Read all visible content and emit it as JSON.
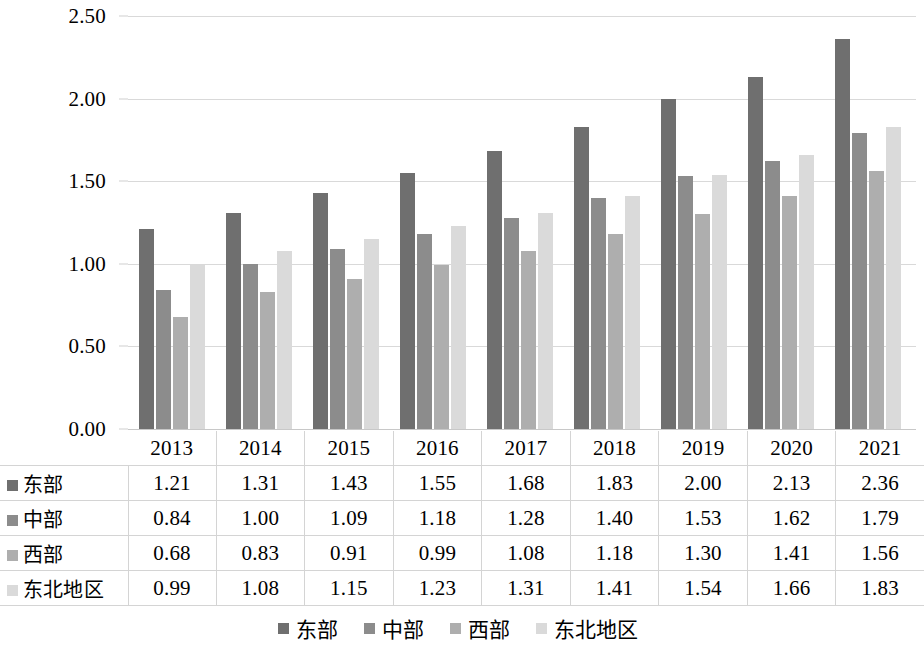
{
  "chart_data": {
    "type": "bar",
    "title": "",
    "xlabel": "",
    "ylabel": "",
    "grid": true,
    "legend_position": "bottom",
    "categories": [
      "2013",
      "2014",
      "2015",
      "2016",
      "2017",
      "2018",
      "2019",
      "2020",
      "2021"
    ],
    "ylim": [
      0.0,
      2.5
    ],
    "ytick_labels": [
      "0.00",
      "0.50",
      "1.00",
      "1.50",
      "2.00",
      "2.50"
    ],
    "ytick_values": [
      0.0,
      0.5,
      1.0,
      1.5,
      2.0,
      2.5
    ],
    "series": [
      {
        "name": "东部",
        "color": "#6f6f6f",
        "values": [
          1.21,
          1.31,
          1.43,
          1.55,
          1.68,
          1.83,
          2.0,
          2.13,
          2.36
        ],
        "labels": [
          "1.21",
          "1.31",
          "1.43",
          "1.55",
          "1.68",
          "1.83",
          "2.00",
          "2.13",
          "2.36"
        ]
      },
      {
        "name": "中部",
        "color": "#8c8c8c",
        "values": [
          0.84,
          1.0,
          1.09,
          1.18,
          1.28,
          1.4,
          1.53,
          1.62,
          1.79
        ],
        "labels": [
          "0.84",
          "1.00",
          "1.09",
          "1.18",
          "1.28",
          "1.40",
          "1.53",
          "1.62",
          "1.79"
        ]
      },
      {
        "name": "西部",
        "color": "#aeaeae",
        "values": [
          0.68,
          0.83,
          0.91,
          0.99,
          1.08,
          1.18,
          1.3,
          1.41,
          1.56
        ],
        "labels": [
          "0.68",
          "0.83",
          "0.91",
          "0.99",
          "1.08",
          "1.18",
          "1.30",
          "1.41",
          "1.56"
        ]
      },
      {
        "name": "东北地区",
        "color": "#dadada",
        "values": [
          0.99,
          1.08,
          1.15,
          1.23,
          1.31,
          1.41,
          1.54,
          1.66,
          1.83
        ],
        "labels": [
          "0.99",
          "1.08",
          "1.15",
          "1.23",
          "1.31",
          "1.41",
          "1.54",
          "1.66",
          "1.83"
        ]
      }
    ]
  },
  "table": {
    "corner_label": "",
    "column_headers": [
      "2013",
      "2014",
      "2015",
      "2016",
      "2017",
      "2018",
      "2019",
      "2020",
      "2021"
    ],
    "rows": [
      {
        "label": "东部",
        "color": "#6f6f6f",
        "cells": [
          "1.21",
          "1.31",
          "1.43",
          "1.55",
          "1.68",
          "1.83",
          "2.00",
          "2.13",
          "2.36"
        ]
      },
      {
        "label": "中部",
        "color": "#8c8c8c",
        "cells": [
          "0.84",
          "1.00",
          "1.09",
          "1.18",
          "1.28",
          "1.40",
          "1.53",
          "1.62",
          "1.79"
        ]
      },
      {
        "label": "西部",
        "color": "#aeaeae",
        "cells": [
          "0.68",
          "0.83",
          "0.91",
          "0.99",
          "1.08",
          "1.18",
          "1.30",
          "1.41",
          "1.56"
        ]
      },
      {
        "label": "东北地区",
        "color": "#dadada",
        "cells": [
          "0.99",
          "1.08",
          "1.15",
          "1.23",
          "1.31",
          "1.41",
          "1.54",
          "1.66",
          "1.83"
        ]
      }
    ]
  },
  "legend": {
    "items": [
      {
        "label": "东部",
        "color": "#6f6f6f"
      },
      {
        "label": "中部",
        "color": "#8c8c8c"
      },
      {
        "label": "西部",
        "color": "#aeaeae"
      },
      {
        "label": "东北地区",
        "color": "#dadada"
      }
    ]
  },
  "colors": {
    "gridline": "#d9d9d9",
    "table_border": "#d4d4d4",
    "background": "#ffffff",
    "text": "#000000"
  }
}
